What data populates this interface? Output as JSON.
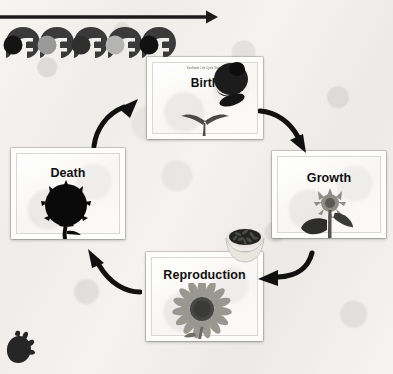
{
  "diagram": {
    "type": "cycle-diagram",
    "subject": "sunflower life cycle",
    "stage_count": 4,
    "background_color": "#f2f1ef"
  },
  "top_arrow": {
    "name": "timeline-arrow",
    "direction": "right",
    "color": "#1b1b1b"
  },
  "silhouette_strip": {
    "name": "grayscale-silhouette-strip",
    "count": 5,
    "shades": [
      "#1a1a1a",
      "#9a9a9a",
      "#2f2f2f",
      "#b4b4b4",
      "#111111"
    ],
    "body_color": "#3a3a3a"
  },
  "corner_silhouette": {
    "name": "corner-silhouette",
    "color": "#262626"
  },
  "cards": [
    {
      "id": "birth",
      "title": "Birth",
      "caption": "Sunflower Life Cycle Stages",
      "art": "sprout-seedling",
      "accent": "#3c6b2f"
    },
    {
      "id": "growth",
      "title": "Growth",
      "caption": "",
      "art": "budding-plant",
      "accent": "#6b6b63"
    },
    {
      "id": "reproduction",
      "title": "Reproduction",
      "caption": "",
      "art": "sunflower-bloom",
      "accent": "#8a8a80"
    },
    {
      "id": "death",
      "title": "Death",
      "caption": "",
      "art": "withered-seedhead",
      "accent": "#101010"
    }
  ],
  "arrows": [
    {
      "id": "death-to-birth",
      "from": "Death",
      "to": "Birth",
      "direction": "up-right"
    },
    {
      "id": "birth-to-growth",
      "from": "Birth",
      "to": "Growth",
      "direction": "down-right"
    },
    {
      "id": "growth-to-reproduction",
      "from": "Growth",
      "to": "Reproduction",
      "direction": "down-left"
    },
    {
      "id": "reproduction-to-death",
      "from": "Reproduction",
      "to": "Death",
      "direction": "up-left"
    }
  ],
  "seed_bowl": {
    "name": "bowl-of-sunflower-seeds",
    "bowl_color": "#d8d6d1",
    "seed_color": "#2a2a28"
  }
}
